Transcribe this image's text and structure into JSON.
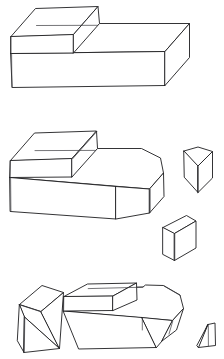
{
  "document": {
    "title": "Hand-drawn stepped block shapes",
    "description": "Line drawing sheet with three rows of 3D block diagrams",
    "background_color": "#ffffff",
    "ink_color": "#1d1d1f",
    "width": 224,
    "height": 359,
    "style": "hand-drawn pen line art, no shading"
  },
  "rows": [
    {
      "id": "row-1",
      "label": "Row 1 - intact stepped block",
      "figures": [
        {
          "id": "fig-1-stepped-block",
          "name": "stepped-block-intact",
          "label": "Stepped rectangular block, whole",
          "bbox": [
            10,
            4,
            190,
            94
          ]
        }
      ]
    },
    {
      "id": "row-2",
      "label": "Row 2 - chamfered block with two detached pieces",
      "figures": [
        {
          "id": "fig-2-chamfered-block",
          "name": "stepped-block-chamfered",
          "label": "Stepped block with chamfered right corner",
          "bbox": [
            8,
            128,
            168,
            235
          ]
        },
        {
          "id": "fig-2-wedge-prism",
          "name": "triangular-prism-piece",
          "label": "Triangular prism piece seen edge-on",
          "bbox": [
            182,
            146,
            214,
            194
          ]
        },
        {
          "id": "fig-2-cut-block",
          "name": "cut-corner-block-piece",
          "label": "Small cut corner block piece",
          "bbox": [
            160,
            214,
            198,
            262
          ]
        }
      ]
    },
    {
      "id": "row-3",
      "label": "Row 3 - tilted wedge, block, and sliver",
      "figures": [
        {
          "id": "fig-3-tilted-wedge",
          "name": "tilted-wedge-piece",
          "label": "Tilted wedge block piece",
          "bbox": [
            14,
            284,
            66,
            356
          ]
        },
        {
          "id": "fig-3-chamfered-block",
          "name": "stepped-block-chamfered-open",
          "label": "Stepped block with chamfer and open cut face",
          "bbox": [
            62,
            282,
            186,
            350
          ]
        },
        {
          "id": "fig-3-sliver",
          "name": "thin-sliver-piece",
          "label": "Thin triangular sliver piece",
          "bbox": [
            196,
            322,
            218,
            352
          ]
        }
      ]
    }
  ],
  "palette": {
    "paper": "#ffffff",
    "stroke_primary": "#1d1d1f",
    "stroke_secondary": "#2c2c30",
    "stroke_light": "#3a3a3e"
  }
}
